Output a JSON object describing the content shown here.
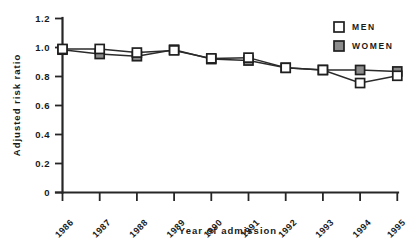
{
  "chart_data": {
    "type": "line",
    "title": "",
    "subtitle": "",
    "xlabel": "Year of admission",
    "ylabel": "Adjusted risk ratio",
    "categories": [
      "1986",
      "1987",
      "1988",
      "1989",
      "1990",
      "1991",
      "1992",
      "1993",
      "1994",
      "1995"
    ],
    "x_tick_labels": [
      "1986",
      "1987",
      "1988",
      "1989",
      "1990",
      "1991",
      "1992",
      "1993",
      "1994",
      "1995"
    ],
    "y_tick_labels": [
      "1.2",
      "1.0",
      "0.8",
      "0.6",
      "0.4",
      "0.2",
      "0"
    ],
    "y_tick_values": [
      1.2,
      1.0,
      0.8,
      0.6,
      0.4,
      0.2,
      0
    ],
    "ylim": [
      0,
      1.2
    ],
    "xlim": [
      1985.5,
      1995.5
    ],
    "grid": false,
    "legend_position": "top-right",
    "series": [
      {
        "name": "MEN",
        "marker": "open-square",
        "color": "#ffffff",
        "edge_color": "#1f1f1f",
        "values": [
          0.99,
          0.99,
          0.965,
          0.98,
          0.925,
          0.93,
          0.86,
          0.845,
          0.755,
          0.805
        ]
      },
      {
        "name": "WOMEN",
        "marker": "filled-square",
        "color": "#8c8c8c",
        "edge_color": "#1f1f1f",
        "values": [
          0.985,
          0.955,
          0.94,
          0.985,
          0.92,
          0.91,
          0.86,
          0.845,
          0.845,
          0.835
        ]
      }
    ]
  },
  "legend": {
    "entries": [
      {
        "label": "MEN",
        "swatch": "open-square"
      },
      {
        "label": "WOMEN",
        "swatch": "filled-square"
      }
    ]
  },
  "colors": {
    "axis": "#262626",
    "line": "#2b2b2b",
    "men_fill": "#ffffff",
    "women_fill": "#8c8c8c",
    "marker_edge": "#1f1f1f",
    "background": "#ffffff",
    "text": "#1a1a1a"
  }
}
